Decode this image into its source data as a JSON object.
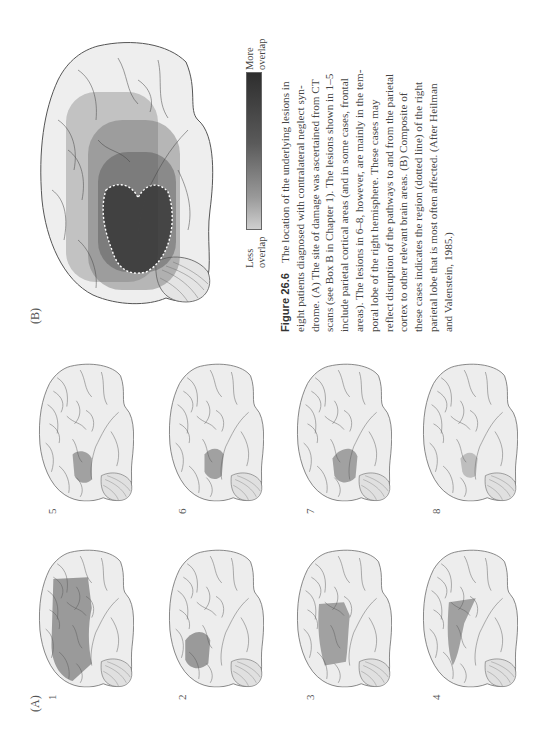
{
  "figure": {
    "number": "Figure 26.6",
    "caption_lines": [
      "The location of the underlying lesions in",
      "eight patients diagnosed with contralateral neglect syn-",
      "drome. (A) The site of damage was ascertained from CT",
      "scans (see Box B in Chapter 1). The lesions shown in 1–5",
      "include parietal cortical areas (and in some cases, frontal",
      "areas). The lesions in 6–8, however, are mainly in the tem-",
      "poral lobe of the right hemisphere. These cases may",
      "reflect disruption of the pathways to and from the parietal",
      "cortex to other relevant brain areas. (B) Composite of",
      "these cases indicates the region (dotted line) of the right",
      "parietal lobe that is most often affected. (After Heilman",
      "and Valenstein, 1985.)"
    ]
  },
  "panel_a": {
    "label": "(A)",
    "cases": [
      {
        "id": "1",
        "lesion": "large parietal + frontal"
      },
      {
        "id": "2",
        "lesion": "small posterior parietal"
      },
      {
        "id": "3",
        "lesion": "parietal band"
      },
      {
        "id": "4",
        "lesion": "parietal wedge"
      },
      {
        "id": "5",
        "lesion": "temporoparietal"
      },
      {
        "id": "6",
        "lesion": "temporal"
      },
      {
        "id": "7",
        "lesion": "temporal"
      },
      {
        "id": "8",
        "lesion": "temporal (faint)"
      }
    ]
  },
  "panel_b": {
    "label": "(B)",
    "legend": {
      "top_label": "More\noverlap",
      "top_line1": "More",
      "top_line2": "overlap",
      "bottom_line1": "Less",
      "bottom_line2": "overlap",
      "dark_color": "#2e2e2e",
      "light_color": "#cfcfcf"
    }
  }
}
